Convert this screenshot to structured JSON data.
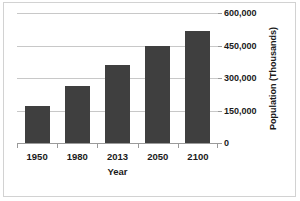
{
  "chart_data": {
    "type": "bar",
    "title": "",
    "categories": [
      "1950",
      "1980",
      "2013",
      "2050",
      "2100"
    ],
    "values": [
      170000,
      265000,
      360000,
      450000,
      515000
    ],
    "series": [
      {
        "name": "Population",
        "values": [
          170000,
          265000,
          360000,
          450000,
          515000
        ]
      }
    ],
    "xlabel": "Year",
    "ylabel": "Population (Thousands)",
    "ylim": [
      0,
      600000
    ],
    "ytick_labels": [
      "0",
      "150,000",
      "300,000",
      "450,000",
      "600,000"
    ],
    "ytick_values": [
      0,
      150000,
      300000,
      450000,
      600000
    ],
    "grid": true,
    "legend": false,
    "bar_color": "#3f3f3f",
    "gridline_color": "#c8c8c8",
    "axis_color": "#9a9a9a",
    "frame_color": "#d2d2d2",
    "background": "#ffffff"
  }
}
